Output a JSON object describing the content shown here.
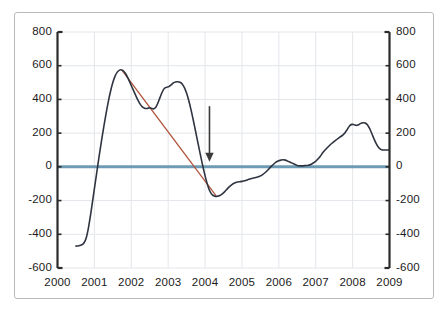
{
  "chart_data": {
    "type": "line",
    "title": "",
    "subtitle": "",
    "xlabel": "",
    "ylabel": "",
    "grid": true,
    "legend_position": "none",
    "xlim": [
      2000,
      2009
    ],
    "ylim": [
      -600,
      800
    ],
    "y_ticks": [
      800,
      600,
      400,
      200,
      0,
      -200,
      -400,
      -600
    ],
    "y_ticks_left": [
      "800",
      "600",
      "400",
      "200",
      "0",
      "-200",
      "-400",
      "-600"
    ],
    "y_ticks_right": [
      "800",
      "600",
      "400",
      "200",
      "0",
      "-200",
      "-400",
      "-600"
    ],
    "x_ticks": [
      2000,
      2001,
      2002,
      2003,
      2004,
      2005,
      2006,
      2007,
      2008,
      2009
    ],
    "x_tick_labels": [
      "2000",
      "2001",
      "2002",
      "2003",
      "2004",
      "2005",
      "2006",
      "2007",
      "2008",
      "2009"
    ],
    "dual_axis": true,
    "series": [
      {
        "name": "main-series",
        "color": "#2e3440",
        "width": 1.6,
        "points": [
          [
            2000.5,
            -470
          ],
          [
            2000.58,
            -468
          ],
          [
            2000.66,
            -462
          ],
          [
            2000.72,
            -450
          ],
          [
            2000.78,
            -420
          ],
          [
            2000.84,
            -360
          ],
          [
            2000.9,
            -280
          ],
          [
            2000.96,
            -190
          ],
          [
            2001.02,
            -100
          ],
          [
            2001.08,
            -10
          ],
          [
            2001.14,
            80
          ],
          [
            2001.2,
            165
          ],
          [
            2001.26,
            245
          ],
          [
            2001.32,
            320
          ],
          [
            2001.38,
            390
          ],
          [
            2001.44,
            450
          ],
          [
            2001.5,
            500
          ],
          [
            2001.56,
            538
          ],
          [
            2001.62,
            562
          ],
          [
            2001.68,
            574
          ],
          [
            2001.74,
            575
          ],
          [
            2001.8,
            566
          ],
          [
            2001.86,
            548
          ],
          [
            2001.92,
            522
          ],
          [
            2001.98,
            492
          ],
          [
            2002.05,
            458
          ],
          [
            2002.12,
            424
          ],
          [
            2002.18,
            396
          ],
          [
            2002.24,
            372
          ],
          [
            2002.3,
            356
          ],
          [
            2002.36,
            348
          ],
          [
            2002.42,
            346
          ],
          [
            2002.48,
            350
          ],
          [
            2002.54,
            348
          ],
          [
            2002.6,
            344
          ],
          [
            2002.66,
            352
          ],
          [
            2002.72,
            378
          ],
          [
            2002.78,
            412
          ],
          [
            2002.84,
            444
          ],
          [
            2002.9,
            466
          ],
          [
            2002.96,
            472
          ],
          [
            2003.02,
            476
          ],
          [
            2003.08,
            486
          ],
          [
            2003.14,
            498
          ],
          [
            2003.2,
            504
          ],
          [
            2003.26,
            505
          ],
          [
            2003.32,
            502
          ],
          [
            2003.38,
            492
          ],
          [
            2003.44,
            470
          ],
          [
            2003.5,
            436
          ],
          [
            2003.56,
            392
          ],
          [
            2003.62,
            338
          ],
          [
            2003.68,
            278
          ],
          [
            2003.74,
            214
          ],
          [
            2003.8,
            150
          ],
          [
            2003.86,
            86
          ],
          [
            2003.92,
            24
          ],
          [
            2003.98,
            -34
          ],
          [
            2004.04,
            -86
          ],
          [
            2004.1,
            -128
          ],
          [
            2004.16,
            -156
          ],
          [
            2004.22,
            -170
          ],
          [
            2004.28,
            -175
          ],
          [
            2004.34,
            -174
          ],
          [
            2004.4,
            -170
          ],
          [
            2004.46,
            -162
          ],
          [
            2004.52,
            -150
          ],
          [
            2004.58,
            -136
          ],
          [
            2004.64,
            -122
          ],
          [
            2004.7,
            -110
          ],
          [
            2004.76,
            -100
          ],
          [
            2004.82,
            -94
          ],
          [
            2004.88,
            -90
          ],
          [
            2004.94,
            -88
          ],
          [
            2005.0,
            -86
          ],
          [
            2005.08,
            -82
          ],
          [
            2005.16,
            -76
          ],
          [
            2005.24,
            -70
          ],
          [
            2005.32,
            -66
          ],
          [
            2005.4,
            -62
          ],
          [
            2005.48,
            -56
          ],
          [
            2005.56,
            -46
          ],
          [
            2005.64,
            -32
          ],
          [
            2005.72,
            -14
          ],
          [
            2005.8,
            4
          ],
          [
            2005.88,
            20
          ],
          [
            2005.94,
            30
          ],
          [
            2006.0,
            36
          ],
          [
            2006.06,
            40
          ],
          [
            2006.12,
            42
          ],
          [
            2006.18,
            40
          ],
          [
            2006.24,
            34
          ],
          [
            2006.32,
            26
          ],
          [
            2006.4,
            18
          ],
          [
            2006.48,
            10
          ],
          [
            2006.56,
            6
          ],
          [
            2006.64,
            6
          ],
          [
            2006.72,
            8
          ],
          [
            2006.8,
            10
          ],
          [
            2006.88,
            16
          ],
          [
            2006.96,
            26
          ],
          [
            2007.04,
            42
          ],
          [
            2007.12,
            62
          ],
          [
            2007.2,
            86
          ],
          [
            2007.28,
            106
          ],
          [
            2007.36,
            124
          ],
          [
            2007.44,
            140
          ],
          [
            2007.52,
            154
          ],
          [
            2007.6,
            168
          ],
          [
            2007.68,
            180
          ],
          [
            2007.74,
            190
          ],
          [
            2007.8,
            204
          ],
          [
            2007.86,
            224
          ],
          [
            2007.92,
            244
          ],
          [
            2007.98,
            252
          ],
          [
            2008.04,
            250
          ],
          [
            2008.1,
            246
          ],
          [
            2008.16,
            250
          ],
          [
            2008.22,
            258
          ],
          [
            2008.28,
            262
          ],
          [
            2008.34,
            260
          ],
          [
            2008.4,
            250
          ],
          [
            2008.46,
            228
          ],
          [
            2008.52,
            198
          ],
          [
            2008.58,
            166
          ],
          [
            2008.64,
            138
          ],
          [
            2008.7,
            116
          ],
          [
            2008.76,
            104
          ],
          [
            2008.82,
            100
          ],
          [
            2008.9,
            100
          ],
          [
            2008.98,
            100
          ]
        ]
      }
    ],
    "zero_line": {
      "name": "zero-reference-line",
      "value": 0,
      "color": "#6d9bb5",
      "width": 3
    },
    "trend_line": {
      "name": "downtrend-line",
      "color": "#b0543c",
      "width": 1.3,
      "x_start": 2001.74,
      "y_start": 575,
      "x_end": 2004.3,
      "y_end": -172
    },
    "annotations": [
      {
        "name": "down-arrow",
        "type": "arrow",
        "direction": "down",
        "x": 2004.12,
        "y_top": 360,
        "y_bottom": 30,
        "color": "#3a3a3a"
      }
    ]
  },
  "figure": {
    "border_color": "#b9b9b9",
    "background": "#ffffff",
    "gridline_color": "#e3e6ea",
    "axis_color": "#2a2a2a"
  }
}
